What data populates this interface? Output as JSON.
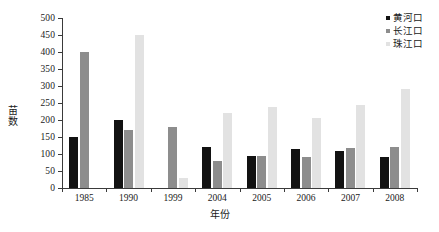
{
  "chart_data": {
    "type": "bar",
    "title": "",
    "subtitle": "",
    "xlabel": "年份",
    "ylabel": "苗数",
    "ylim": [
      0,
      500
    ],
    "ytick_step": 50,
    "yticks": [
      0,
      50,
      100,
      150,
      200,
      250,
      300,
      350,
      400,
      450,
      500
    ],
    "grid": false,
    "legend_position": "top-right",
    "categories": [
      "1985",
      "1990",
      "1999",
      "2004",
      "2005",
      "2006",
      "2007",
      "2008"
    ],
    "series": [
      {
        "name": "黄河口",
        "color": "#121212",
        "values": [
          150,
          200,
          0,
          120,
          95,
          115,
          110,
          90
        ]
      },
      {
        "name": "长江口",
        "color": "#8d8d8d",
        "values": [
          400,
          170,
          180,
          80,
          95,
          92,
          118,
          120
        ]
      },
      {
        "name": "珠江口",
        "color": "#e2e2e2",
        "values": [
          0,
          450,
          30,
          222,
          238,
          207,
          245,
          290
        ]
      }
    ]
  },
  "legend": {
    "items": [
      {
        "label": "黄河口",
        "color": "#121212",
        "marker": "square-swatch-icon"
      },
      {
        "label": "长江口",
        "color": "#8d8d8d",
        "marker": "square-swatch-icon"
      },
      {
        "label": "珠江口",
        "color": "#e2e2e2",
        "marker": "square-swatch-icon"
      }
    ]
  }
}
